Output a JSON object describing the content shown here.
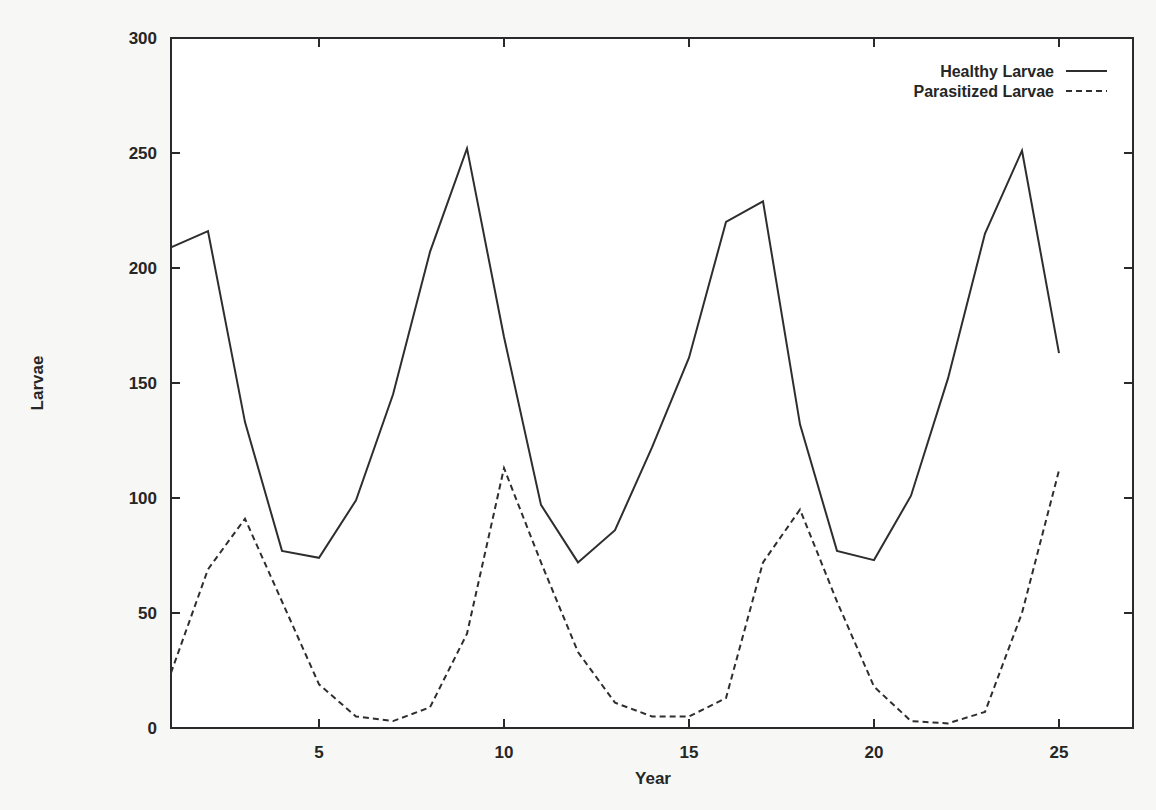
{
  "chart_data": {
    "type": "line",
    "title": "",
    "xlabel": "Year",
    "ylabel": "Larvae",
    "xlim": [
      1,
      27
    ],
    "ylim": [
      0,
      300
    ],
    "grid": false,
    "legend_position": "top-right",
    "x_ticks": [
      5,
      10,
      15,
      20,
      25
    ],
    "y_ticks": [
      0,
      50,
      100,
      150,
      200,
      250,
      300
    ],
    "x": [
      1,
      2,
      3,
      4,
      5,
      6,
      7,
      8,
      9,
      10,
      11,
      12,
      13,
      14,
      15,
      16,
      17,
      18,
      19,
      20,
      21,
      22,
      23,
      24,
      25
    ],
    "series": [
      {
        "name": "Healthy Larvae",
        "style": "solid",
        "values": [
          209,
          216,
          133,
          77,
          74,
          99,
          145,
          207,
          252,
          170,
          97,
          72,
          86,
          122,
          161,
          220,
          229,
          132,
          77,
          73,
          101,
          152,
          215,
          251,
          163
        ]
      },
      {
        "name": "Parasitized Larvae",
        "style": "dashed",
        "values": [
          24,
          69,
          91,
          55,
          19,
          5,
          3,
          9,
          41,
          113,
          72,
          33,
          11,
          5,
          5,
          13,
          72,
          95,
          55,
          18,
          3,
          2,
          7,
          50,
          112
        ]
      }
    ]
  },
  "colors": {
    "line": "#2e2e2e",
    "background": "#f7f7f5",
    "plot_background": "#ffffff"
  }
}
